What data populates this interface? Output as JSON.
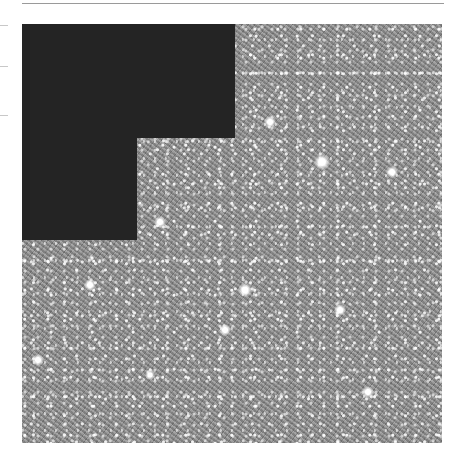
{
  "image": {
    "description": "Dense star field (globular cluster) in grayscale with a black L-shaped masked region in the upper-left",
    "colors": {
      "background": "#ffffff",
      "mask": "#242424",
      "starfield_base": "#8a8a8a"
    },
    "bright_stars": [
      {
        "x": 56,
        "y": 45,
        "r": 7
      },
      {
        "x": 66,
        "y": 86,
        "r": 6
      },
      {
        "x": 88,
        "y": 62,
        "r": 5
      },
      {
        "x": 215,
        "y": 40,
        "r": 6
      },
      {
        "x": 270,
        "y": 122,
        "r": 6
      },
      {
        "x": 322,
        "y": 162,
        "r": 8
      },
      {
        "x": 392,
        "y": 172,
        "r": 6
      },
      {
        "x": 160,
        "y": 222,
        "r": 6
      },
      {
        "x": 125,
        "y": 228,
        "r": 7
      },
      {
        "x": 90,
        "y": 285,
        "r": 6
      },
      {
        "x": 245,
        "y": 290,
        "r": 7
      },
      {
        "x": 340,
        "y": 310,
        "r": 6
      },
      {
        "x": 225,
        "y": 330,
        "r": 6
      },
      {
        "x": 38,
        "y": 360,
        "r": 6
      },
      {
        "x": 150,
        "y": 375,
        "r": 5
      },
      {
        "x": 368,
        "y": 392,
        "r": 6
      }
    ]
  }
}
